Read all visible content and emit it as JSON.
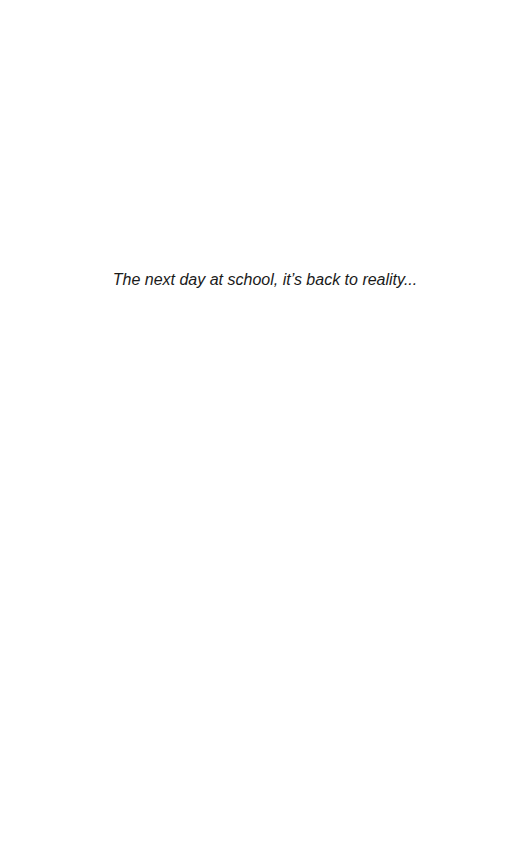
{
  "page": {
    "background_color": "#ffffff",
    "text_color": "#1a1a1a"
  },
  "caption": {
    "text": "The next day at school, it’s back to reality..."
  }
}
